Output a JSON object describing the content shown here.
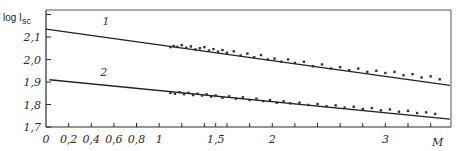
{
  "chart_data": {
    "type": "scatter",
    "title": "",
    "xlabel": "M",
    "ylabel": "log I",
    "ylabel_sub": "sc",
    "xlim": [
      0,
      3.58
    ],
    "ylim": [
      1.7,
      2.22
    ],
    "grid": false,
    "x_ticks": [
      0,
      0.2,
      0.4,
      0.6,
      0.8,
      1.0,
      1.2,
      1.4,
      1.5,
      1.6,
      1.8,
      2.0,
      2.2,
      2.4,
      2.6,
      2.8,
      3.0,
      3.2,
      3.4
    ],
    "x_tick_labels": [
      {
        "value": 0,
        "label": "0"
      },
      {
        "value": 0.2,
        "label": "0,2"
      },
      {
        "value": 0.4,
        "label": "0,4"
      },
      {
        "value": 0.6,
        "label": "0,6"
      },
      {
        "value": 0.8,
        "label": "0,8"
      },
      {
        "value": 1.0,
        "label": "1"
      },
      {
        "value": 1.5,
        "label": "1,5"
      },
      {
        "value": 2.0,
        "label": "2"
      },
      {
        "value": 3.0,
        "label": "3"
      }
    ],
    "y_ticks": [
      1.7,
      1.8,
      1.9,
      2.0,
      2.1,
      2.2
    ],
    "y_tick_labels": [
      {
        "value": 1.7,
        "label": "1,7"
      },
      {
        "value": 1.8,
        "label": "1,8"
      },
      {
        "value": 1.9,
        "label": "1,9"
      },
      {
        "value": 2.0,
        "label": "2,0"
      },
      {
        "value": 2.1,
        "label": "2,1"
      }
    ],
    "series": [
      {
        "name": "1",
        "label_pos": {
          "x": 0.5,
          "y": 2.155
        },
        "fit": {
          "x": [
            0,
            3.57
          ],
          "y": [
            2.135,
            1.885
          ]
        },
        "points": {
          "x": [
            1.1,
            1.13,
            1.16,
            1.2,
            1.24,
            1.28,
            1.32,
            1.36,
            1.4,
            1.44,
            1.48,
            1.52,
            1.56,
            1.6,
            1.66,
            1.72,
            1.78,
            1.84,
            1.9,
            1.96,
            2.02,
            2.08,
            2.14,
            2.2,
            2.28,
            2.36,
            2.44,
            2.52,
            2.6,
            2.68,
            2.76,
            2.84,
            2.92,
            3.0,
            3.08,
            3.16,
            3.24,
            3.32,
            3.4,
            3.48
          ],
          "y": [
            2.055,
            2.06,
            2.056,
            2.064,
            2.052,
            2.058,
            2.045,
            2.05,
            2.055,
            2.04,
            2.046,
            2.035,
            2.042,
            2.03,
            2.036,
            2.018,
            2.026,
            2.01,
            2.02,
            2.0,
            2.004,
            1.99,
            2.0,
            1.985,
            1.99,
            1.97,
            1.978,
            1.96,
            1.966,
            1.952,
            1.96,
            1.945,
            1.95,
            1.94,
            1.945,
            1.93,
            1.935,
            1.92,
            1.925,
            1.912
          ]
        }
      },
      {
        "name": "2",
        "label_pos": {
          "x": 0.48,
          "y": 1.925
        },
        "fit": {
          "x": [
            0.03,
            3.57
          ],
          "y": [
            1.91,
            1.735
          ]
        },
        "points": {
          "x": [
            1.1,
            1.14,
            1.18,
            1.22,
            1.26,
            1.3,
            1.34,
            1.38,
            1.42,
            1.46,
            1.5,
            1.56,
            1.62,
            1.68,
            1.74,
            1.8,
            1.86,
            1.92,
            1.98,
            2.04,
            2.1,
            2.16,
            2.24,
            2.32,
            2.4,
            2.48,
            2.56,
            2.64,
            2.72,
            2.8,
            2.88,
            2.96,
            3.04,
            3.12,
            3.2,
            3.28,
            3.36,
            3.44
          ],
          "y": [
            1.852,
            1.848,
            1.855,
            1.846,
            1.852,
            1.842,
            1.848,
            1.84,
            1.845,
            1.835,
            1.84,
            1.83,
            1.836,
            1.826,
            1.832,
            1.82,
            1.826,
            1.815,
            1.82,
            1.808,
            1.814,
            1.805,
            1.808,
            1.798,
            1.802,
            1.792,
            1.796,
            1.786,
            1.79,
            1.78,
            1.784,
            1.774,
            1.778,
            1.768,
            1.772,
            1.762,
            1.765,
            1.758
          ]
        }
      }
    ]
  }
}
